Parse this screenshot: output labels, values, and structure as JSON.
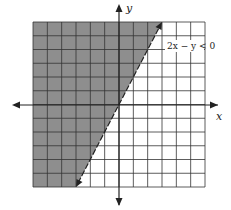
{
  "chart_data": {
    "type": "inequality-graph",
    "title": "",
    "inequality": "2x − y < 0",
    "boundary_line": {
      "equation": "y = 2x",
      "slope": 2,
      "intercept": 0,
      "style": "dashed"
    },
    "shaded_region": "left of / above the line (y > 2x)",
    "xlabel": "x",
    "ylabel": "y",
    "xlim": [
      -6,
      6
    ],
    "ylim": [
      -6,
      6
    ],
    "grid": true,
    "colors": {
      "shade": "#8e8e8e",
      "grid": "#333333",
      "axis": "#222222",
      "background": "#ffffff"
    }
  },
  "labels": {
    "x_axis": "x",
    "y_axis": "y",
    "inequality": "2x − y < 0"
  }
}
